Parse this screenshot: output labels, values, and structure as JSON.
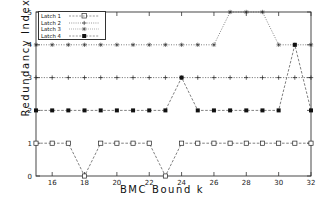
{
  "chart_data": {
    "type": "line",
    "title": "",
    "xlabel": "BMC Bound k",
    "ylabel": "Redundancy Index",
    "xlim": [
      15,
      32
    ],
    "ylim": [
      0,
      5
    ],
    "xticks": [
      16,
      18,
      20,
      22,
      24,
      26,
      28,
      30,
      32
    ],
    "yticks": [
      0,
      1,
      2,
      3,
      4,
      5
    ],
    "grid": false,
    "legend_position": "top-left",
    "x": [
      15,
      16,
      17,
      18,
      19,
      20,
      21,
      22,
      23,
      24,
      25,
      26,
      27,
      28,
      29,
      30,
      31,
      32
    ],
    "series": [
      {
        "name": "Latch 1",
        "marker": "open-square",
        "values": [
          1,
          1,
          1,
          0,
          1,
          1,
          1,
          1,
          0,
          1,
          1,
          1,
          1,
          1,
          1,
          1,
          1,
          1
        ]
      },
      {
        "name": "Latch 2",
        "marker": "plus",
        "values": [
          3,
          3,
          3,
          3,
          3,
          3,
          3,
          3,
          3,
          3,
          3,
          3,
          3,
          3,
          3,
          3,
          3,
          3
        ]
      },
      {
        "name": "Latch 3",
        "marker": "star",
        "values": [
          4,
          4,
          4,
          4,
          4,
          4,
          4,
          4,
          4,
          4,
          4,
          4,
          5,
          5,
          5,
          4,
          4,
          4
        ]
      },
      {
        "name": "Latch 4",
        "marker": "filled-square",
        "values": [
          2,
          2,
          2,
          2,
          2,
          2,
          2,
          2,
          2,
          3,
          2,
          2,
          2,
          2,
          2,
          2,
          4,
          2
        ]
      }
    ]
  },
  "axes": {
    "xtick_labels": [
      "16",
      "18",
      "20",
      "22",
      "24",
      "26",
      "28",
      "30",
      "32"
    ],
    "ytick_labels": [
      "0",
      "1",
      "2",
      "3",
      "4",
      "5"
    ],
    "xlabel": "BMC Bound k",
    "ylabel": "Redundancy Index"
  },
  "legend": {
    "items": [
      {
        "label": "Latch 1"
      },
      {
        "label": "Latch 2"
      },
      {
        "label": "Latch 3"
      },
      {
        "label": "Latch 4"
      }
    ]
  },
  "colors": {
    "line": "#555555",
    "axis": "#333333",
    "text": "#111111",
    "background": "#ffffff"
  }
}
